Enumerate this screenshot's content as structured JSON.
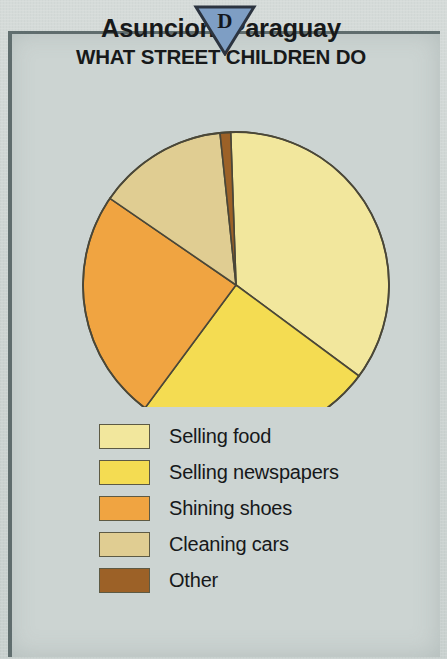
{
  "marker": {
    "letter": "D",
    "fill": "#7e9ec4",
    "stroke": "#2c3440",
    "icon": "down-triangle-marker"
  },
  "header": {
    "title": "Asuncion, Paraguay",
    "subtitle": "WHAT STREET CHILDREN DO"
  },
  "colors": {
    "background": "#ccd4d2",
    "frame": "#5c6a6b",
    "outline": "#5d5a44"
  },
  "chart_data": {
    "type": "pie",
    "title": "Asuncion, Paraguay",
    "subtitle": "WHAT STREET CHILDREN DO",
    "xlabel": "",
    "ylabel": "",
    "legend_position": "bottom-left",
    "grid": false,
    "start_angle_deg": 358,
    "direction": "clockwise",
    "categories": [
      "Selling food",
      "Selling newspapers",
      "Shining shoes",
      "Cleaning cars",
      "Other"
    ],
    "values": [
      36,
      25,
      24,
      14,
      1
    ],
    "angles_deg": [
      128.5,
      90,
      88,
      49.5,
      4
    ],
    "colors": [
      "#f2e79d",
      "#f4dc52",
      "#f0a441",
      "#e0cd92",
      "#9c6127"
    ],
    "slices": [
      {
        "label": "Selling food",
        "value": 36,
        "angle_deg": 128.5,
        "color": "#f2e79d"
      },
      {
        "label": "Selling newspapers",
        "value": 25,
        "angle_deg": 90.0,
        "color": "#f4dc52"
      },
      {
        "label": "Shining shoes",
        "value": 24,
        "angle_deg": 88.0,
        "color": "#f0a441"
      },
      {
        "label": "Cleaning cars",
        "value": 14,
        "angle_deg": 49.5,
        "color": "#e0cd92"
      },
      {
        "label": "Other",
        "value": 1,
        "angle_deg": 4.0,
        "color": "#9c6127"
      }
    ]
  },
  "legend": {
    "items": [
      {
        "label": "Selling food",
        "color": "#f2e79d"
      },
      {
        "label": "Selling newspapers",
        "color": "#f4dc52"
      },
      {
        "label": "Shining shoes",
        "color": "#f0a441"
      },
      {
        "label": "Cleaning cars",
        "color": "#e0cd92"
      },
      {
        "label": "Other",
        "color": "#9c6127"
      }
    ]
  }
}
